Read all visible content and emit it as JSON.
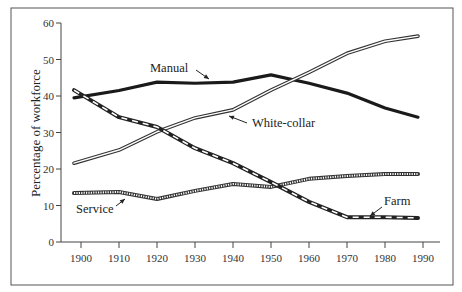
{
  "chart_data": {
    "type": "line",
    "title": "",
    "xlabel": "",
    "ylabel": "Percentage of workforce",
    "x": [
      1900,
      1910,
      1920,
      1930,
      1940,
      1950,
      1960,
      1970,
      1980,
      1990
    ],
    "x_ticks": [
      "1900",
      "1910",
      "1920",
      "1930",
      "1940",
      "1950",
      "1960",
      "1970",
      "1980",
      "1990"
    ],
    "y_ticks": [
      "0",
      "10",
      "20",
      "30",
      "40",
      "50",
      "60"
    ],
    "ylim": [
      0,
      60
    ],
    "grid": false,
    "legend": "inline labels with arrows",
    "series": [
      {
        "name": "Manual",
        "style": "thick-solid",
        "values": [
          39.5,
          41.5,
          43.8,
          43.5,
          43.8,
          45.8,
          43.5,
          40.8,
          36.7,
          34.2
        ]
      },
      {
        "name": "White-collar",
        "style": "double-line",
        "values": [
          21.6,
          25.2,
          30.2,
          34.0,
          36.2,
          41.6,
          46.5,
          51.7,
          55.0,
          56.4
        ]
      },
      {
        "name": "Service",
        "style": "hatched",
        "values": [
          13.4,
          13.7,
          11.8,
          14.0,
          15.9,
          15.1,
          17.3,
          18.1,
          18.6,
          18.6
        ]
      },
      {
        "name": "Farm",
        "style": "dashed-double",
        "values": [
          41.6,
          34.2,
          31.5,
          25.7,
          21.6,
          16.4,
          11.0,
          6.8,
          6.8,
          6.6
        ]
      }
    ],
    "annotations": [
      {
        "text": "Manual",
        "points_to": "Manual"
      },
      {
        "text": "White-collar",
        "points_to": "White-collar"
      },
      {
        "text": "Service",
        "points_to": "Service"
      },
      {
        "text": "Farm",
        "points_to": "Farm"
      }
    ]
  }
}
